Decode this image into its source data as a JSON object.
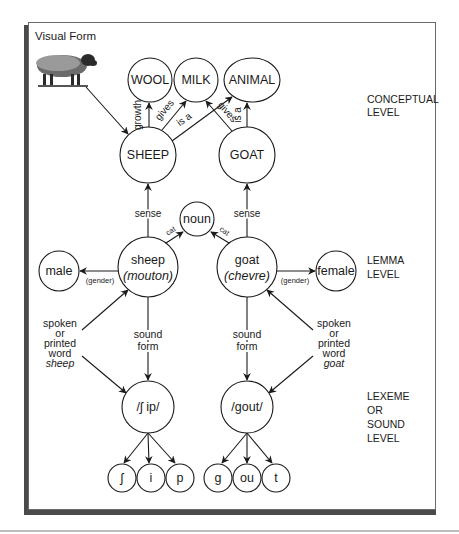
{
  "visual_form": {
    "title": "Visual Form",
    "image": "sheep-photo-icon"
  },
  "levels": {
    "conceptual": [
      "CONCEPTUAL",
      "LEVEL"
    ],
    "lemma": [
      "LEMMA",
      "LEVEL"
    ],
    "lexeme": [
      "LEXEME",
      "OR",
      "SOUND",
      "LEVEL"
    ]
  },
  "conceptual_nodes": {
    "wool": "WOOL",
    "milk": "MILK",
    "animal": "ANIMAL",
    "sheep": "SHEEP",
    "goat": "GOAT"
  },
  "conceptual_edges": {
    "growth": "growth",
    "gives_sheep": "gives",
    "is_a_sheep": "is a",
    "gives_goat": "gives",
    "is_a_goat": "is a"
  },
  "lemma_nodes": {
    "noun": "noun",
    "sheep_word": "sheep",
    "sheep_french": "(mouton)",
    "goat_word": "goat",
    "goat_french": "(chevre)",
    "male": "male",
    "female": "female"
  },
  "lemma_edges": {
    "sense_left": "sense",
    "sense_right": "sense",
    "cat_left": "cat",
    "cat_right": "cat",
    "gender_left": "(gender)",
    "gender_right": "(gender)"
  },
  "input_labels": {
    "left": [
      "spoken",
      "or",
      "printed",
      "word"
    ],
    "left_word": "sheep",
    "right": [
      "spoken",
      "or",
      "printed",
      "word"
    ],
    "right_word": "goat"
  },
  "sound_form": {
    "left": [
      "sound",
      "form"
    ],
    "right": [
      "sound",
      "form"
    ]
  },
  "lexeme_nodes": {
    "sheep": "/ʃ ip/",
    "goat": "/gout/"
  },
  "phonemes": {
    "sheep": [
      "ʃ",
      "i",
      "p"
    ],
    "goat": [
      "g",
      "ou",
      "t"
    ]
  }
}
